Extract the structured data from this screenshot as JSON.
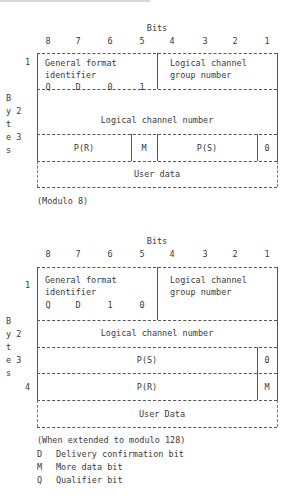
{
  "diagrams": [
    {
      "title": "Bits",
      "bit_numbers": [
        "8",
        "7",
        "6",
        "5",
        "4",
        "3",
        "2",
        "1"
      ],
      "byte_axis_label": [
        "B",
        "y",
        "t",
        "e",
        "s"
      ],
      "rows": [
        {
          "byte": "1",
          "fields": [
            {
              "label_line1": "General format",
              "label_line2": "identifier",
              "bits": [
                "Q",
                "D",
                "0",
                "1"
              ]
            },
            {
              "label_line1": "Logical channel",
              "label_line2": "group number"
            }
          ]
        },
        {
          "byte": "2",
          "fields": [
            {
              "label": "Logical channel number"
            }
          ]
        },
        {
          "byte": "3",
          "fields": [
            {
              "label": "P(R)"
            },
            {
              "label": "M"
            },
            {
              "label": "P(S)"
            },
            {
              "label": "0"
            }
          ]
        },
        {
          "byte": "",
          "fields": [
            {
              "label": "User data"
            }
          ]
        }
      ],
      "note": "(Modulo 8)"
    },
    {
      "title": "Bits",
      "bit_numbers": [
        "8",
        "7",
        "6",
        "5",
        "4",
        "3",
        "2",
        "1"
      ],
      "byte_axis_label": [
        "B",
        "y",
        "t",
        "e",
        "s"
      ],
      "rows": [
        {
          "byte": "1",
          "fields": [
            {
              "label_line1": "General format",
              "label_line2": "identifier",
              "bits": [
                "Q",
                "D",
                "1",
                "0"
              ]
            },
            {
              "label_line1": "Logical channel",
              "label_line2": "group number"
            }
          ]
        },
        {
          "byte": "2",
          "fields": [
            {
              "label": "Logical channel number"
            }
          ]
        },
        {
          "byte": "3",
          "fields": [
            {
              "label": "P(S)"
            },
            {
              "label": "0"
            }
          ]
        },
        {
          "byte": "4",
          "fields": [
            {
              "label": "P(R)"
            },
            {
              "label": "M"
            }
          ]
        },
        {
          "byte": "",
          "fields": [
            {
              "label": "User Data"
            }
          ]
        }
      ],
      "note": "(When extended to modulo 128)"
    }
  ],
  "legend": [
    {
      "key": "D",
      "text": "Delivery confirmation bit"
    },
    {
      "key": "M",
      "text": "More data bit"
    },
    {
      "key": "Q",
      "text": "Qualifier bit"
    }
  ]
}
